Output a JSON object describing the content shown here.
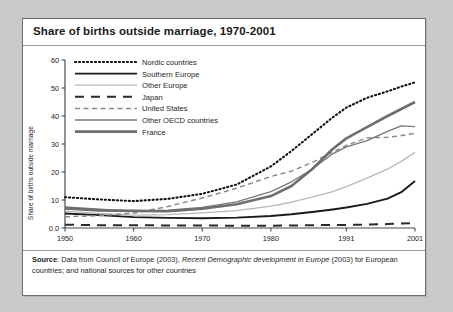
{
  "card": {
    "title": "Share of births outside marriage, 1970-2001",
    "source_prefix": "Source",
    "source_a": ": Data from Council of Europe (2003), ",
    "source_italic": "Recent Demographic development in Europe",
    "source_b": " (2003) for European countries; and national sources for other countries"
  },
  "chart_data": {
    "type": "line",
    "title": "Share of births outside marriage, 1970-2001",
    "xlabel": "",
    "ylabel": "Share of births outside marriage",
    "xlim": [
      1950,
      2001
    ],
    "ylim": [
      0,
      60
    ],
    "grid": false,
    "legend_position": "top-left-inside",
    "xticks": [
      "1950",
      "1960",
      "1970",
      "1980",
      "1991",
      "2001"
    ],
    "xtick_values": [
      1950,
      1960,
      1970,
      1980,
      1991,
      2001
    ],
    "yticks": [
      "0.0",
      "10",
      "20",
      "30",
      "40",
      "50",
      "60"
    ],
    "ytick_values": [
      0,
      10,
      20,
      30,
      40,
      50,
      60
    ],
    "x": [
      1950,
      1955,
      1960,
      1965,
      1970,
      1975,
      1980,
      1983,
      1986,
      1989,
      1991,
      1994,
      1997,
      1999,
      2001
    ],
    "series": [
      {
        "name": "Nordic countries",
        "style": "dotted",
        "color": "#111111",
        "width": 2.1,
        "values": [
          11.0,
          10.2,
          9.6,
          10.4,
          12.2,
          15.5,
          22.0,
          27.5,
          33.5,
          39.5,
          43.0,
          46.5,
          48.8,
          50.5,
          52.0
        ]
      },
      {
        "name": "Southern Europe",
        "style": "solid",
        "color": "#1a1a1a",
        "width": 1.9,
        "values": [
          5.2,
          4.6,
          3.9,
          3.6,
          3.5,
          3.7,
          4.3,
          4.9,
          5.7,
          6.6,
          7.3,
          8.6,
          10.5,
          12.8,
          16.8
        ]
      },
      {
        "name": "Other Europe",
        "style": "solid",
        "color": "#b8b8b8",
        "width": 1.3,
        "values": [
          6.0,
          5.2,
          4.6,
          4.8,
          5.4,
          6.2,
          7.8,
          9.2,
          11.0,
          13.0,
          14.8,
          17.8,
          21.0,
          23.8,
          27.0
        ]
      },
      {
        "name": "Japan",
        "style": "dashed-thick",
        "color": "#2a2a2a",
        "width": 2.0,
        "values": [
          1.2,
          1.0,
          1.0,
          0.9,
          0.9,
          0.8,
          0.8,
          0.9,
          1.0,
          1.1,
          1.1,
          1.2,
          1.4,
          1.6,
          1.8
        ]
      },
      {
        "name": "United States",
        "style": "dashed-thin",
        "color": "#8a8a8a",
        "width": 1.5,
        "values": [
          4.0,
          4.4,
          5.3,
          7.7,
          10.7,
          14.2,
          18.4,
          20.3,
          23.4,
          27.1,
          29.5,
          32.2,
          32.4,
          33.0,
          33.8
        ]
      },
      {
        "name": "Other OECD countries",
        "style": "solid",
        "color": "#777777",
        "width": 1.3,
        "values": [
          7.5,
          6.7,
          6.0,
          6.4,
          7.4,
          9.3,
          13.0,
          16.5,
          21.0,
          26.5,
          29.0,
          31.2,
          34.5,
          36.5,
          36.2
        ]
      },
      {
        "name": "France",
        "style": "solid",
        "color": "#6e6e6e",
        "width": 2.6,
        "values": [
          7.0,
          6.3,
          6.1,
          6.0,
          6.9,
          8.5,
          11.4,
          15.0,
          21.0,
          28.2,
          32.0,
          36.0,
          40.0,
          42.5,
          45.0
        ]
      }
    ]
  }
}
